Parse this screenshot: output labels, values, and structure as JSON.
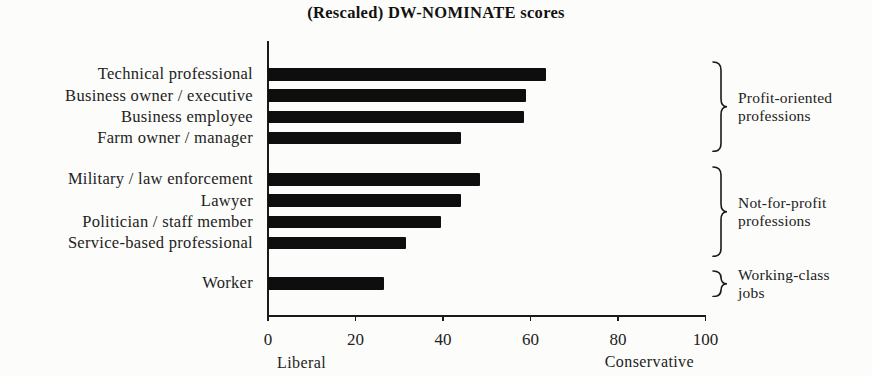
{
  "figure": {
    "title": "(Rescaled) DW-NOMINATE scores"
  },
  "chart_data": {
    "type": "bar",
    "orientation": "horizontal",
    "title": "(Rescaled) DW-NOMINATE scores",
    "xlabel": "",
    "ylabel": "",
    "xlim": [
      0,
      100
    ],
    "x_ticks": [
      0,
      20,
      40,
      60,
      80,
      100
    ],
    "x_axis_end_labels": {
      "left": "Liberal",
      "right": "Conservative"
    },
    "grid": false,
    "legend": false,
    "bar_color": "#0e0e0e",
    "axis_color": "#1a1a1a",
    "groups": [
      {
        "label": "Profit-oriented professions",
        "items": [
          {
            "category": "Technical professional",
            "value": 63.5
          },
          {
            "category": "Business owner / executive",
            "value": 59
          },
          {
            "category": "Business employee",
            "value": 58.5
          },
          {
            "category": "Farm owner / manager",
            "value": 44
          }
        ]
      },
      {
        "label": "Not-for-profit professions",
        "items": [
          {
            "category": "Military / law enforcement",
            "value": 48.5
          },
          {
            "category": "Lawyer",
            "value": 44
          },
          {
            "category": "Politician / staff member",
            "value": 39.5
          },
          {
            "category": "Service-based professional",
            "value": 31.5
          }
        ]
      },
      {
        "label": "Working-class jobs",
        "items": [
          {
            "category": "Worker",
            "value": 26.5
          }
        ]
      }
    ]
  }
}
